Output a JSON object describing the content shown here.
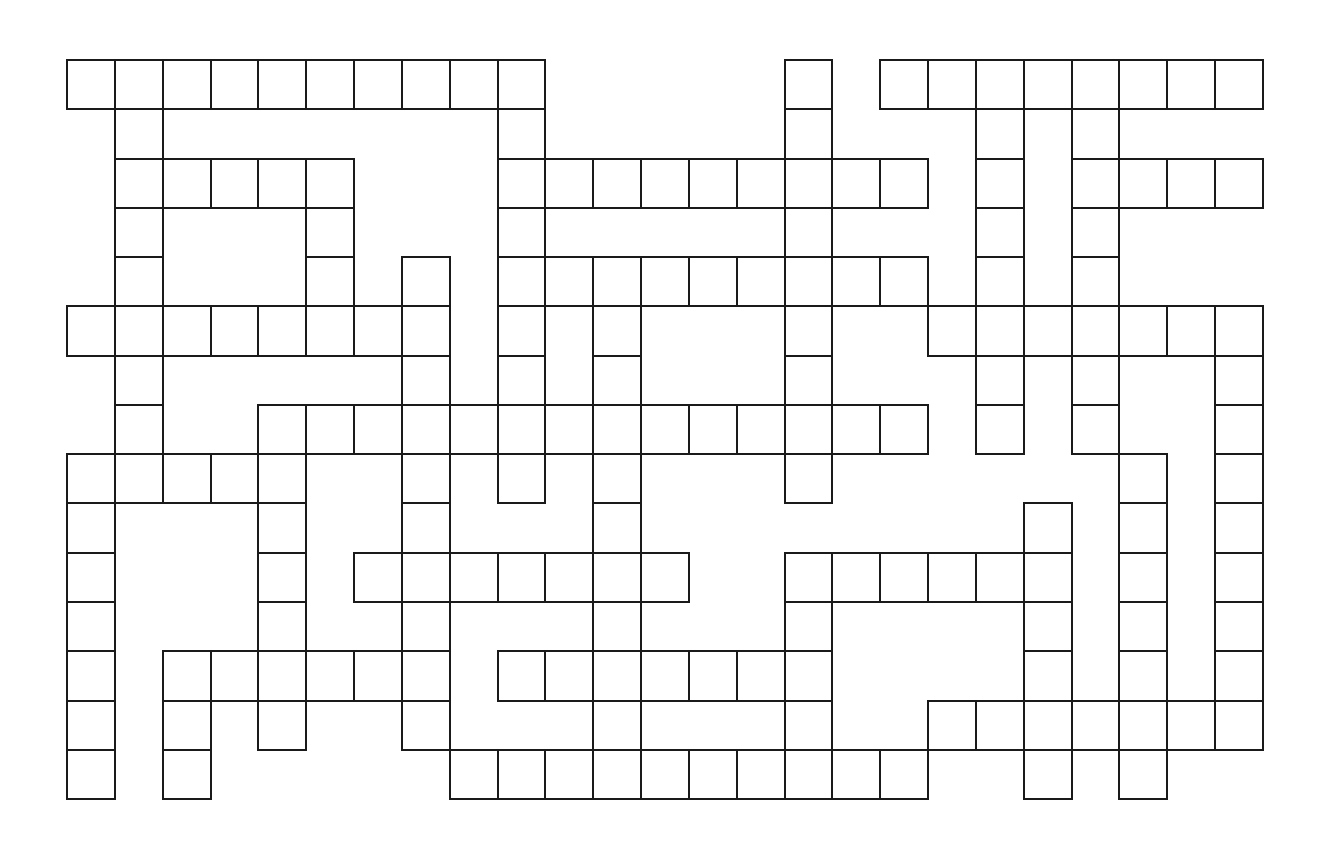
{
  "puzzle": {
    "title": "Crossword Grid",
    "cols": 25,
    "rows": 15,
    "origin_x": 67,
    "origin_y": 60,
    "cell_w": 47.84,
    "cell_h": 49.27,
    "line_color": "#1a1a1a",
    "cell_color": "#ffffff",
    "grid": [
      "##########.....#.########",
      ".#.......#.....#...#.#...",
      ".#####...#########.#.####",
      ".#...#...#.....#...#.#...",
      ".#...#.#.#########.#.#...",
      "########.#.#...#..#######",
      ".#.....#.#.#...#...#.#..#",
      ".#..##############.#.#..#",
      "#####..#.#.#...#......#.#",
      "#...#..#...#........#.#.#",
      "#...#.#######..######.#.#",
      "#...#..#...#...#....#.#.#",
      "#.######.#######....#.#.#",
      "#.#.#..#...#...#..#######",
      "#.#.....##########..#.#.."
    ]
  }
}
